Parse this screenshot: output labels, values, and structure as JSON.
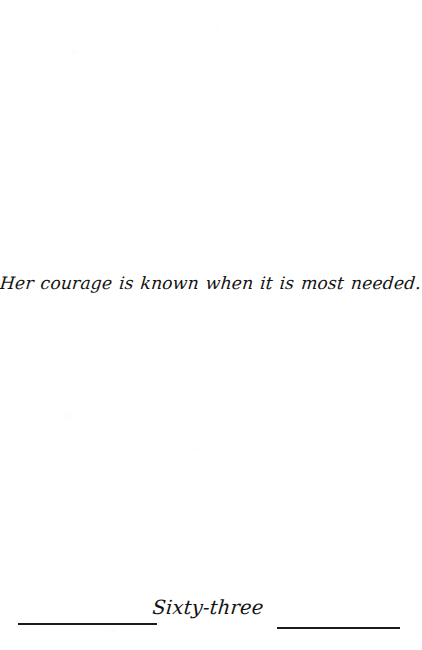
{
  "page": {
    "background_color": "#ffffff",
    "ink_color": "#131313",
    "rule_color": "#1b1b1b"
  },
  "epigraph": {
    "text": "Her courage is known when it is most needed."
  },
  "folio": {
    "page_number_text": "Sixty-three",
    "left_rule": "",
    "right_rule": ""
  }
}
